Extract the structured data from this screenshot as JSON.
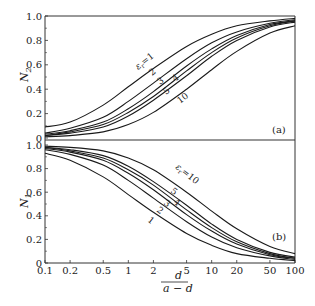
{
  "chart_data": [
    {
      "type": "line",
      "panel": "(a)",
      "title": "",
      "xlabel": "d / (a - d)",
      "ylabel": "N2",
      "xscale": "log",
      "xlim": [
        0.1,
        100
      ],
      "ylim": [
        0,
        1.0
      ],
      "grid": false,
      "x": [
        0.1,
        0.2,
        0.5,
        1,
        2,
        5,
        10,
        20,
        50,
        100
      ],
      "series": [
        {
          "name": "εr=1",
          "label": "εr=1",
          "values": [
            0.09,
            0.13,
            0.27,
            0.42,
            0.57,
            0.75,
            0.85,
            0.92,
            0.96,
            0.98
          ]
        },
        {
          "name": "εr=2",
          "label": "2",
          "values": [
            0.04,
            0.08,
            0.17,
            0.3,
            0.45,
            0.65,
            0.78,
            0.87,
            0.94,
            0.97
          ]
        },
        {
          "name": "εr=3",
          "label": "3",
          "values": [
            0.03,
            0.06,
            0.13,
            0.24,
            0.38,
            0.59,
            0.73,
            0.84,
            0.93,
            0.96
          ]
        },
        {
          "name": "εr=4",
          "label": "4",
          "values": [
            0.02,
            0.05,
            0.11,
            0.21,
            0.34,
            0.55,
            0.7,
            0.82,
            0.92,
            0.96
          ]
        },
        {
          "name": "εr=5",
          "label": "5",
          "values": [
            0.02,
            0.04,
            0.09,
            0.18,
            0.31,
            0.51,
            0.67,
            0.8,
            0.91,
            0.95
          ]
        },
        {
          "name": "εr=10",
          "label": "10",
          "values": [
            0.01,
            0.02,
            0.05,
            0.11,
            0.21,
            0.4,
            0.56,
            0.71,
            0.86,
            0.92
          ]
        }
      ],
      "yticks": [
        "0",
        "0.2",
        "0.4",
        "0.6",
        "0.8",
        "1.0"
      ]
    },
    {
      "type": "line",
      "panel": "(b)",
      "title": "",
      "xlabel": "d / (a - d)",
      "ylabel": "N1",
      "xscale": "log",
      "xlim": [
        0.1,
        100
      ],
      "ylim": [
        0,
        1.0
      ],
      "grid": false,
      "x": [
        0.1,
        0.2,
        0.5,
        1,
        2,
        5,
        10,
        20,
        50,
        100
      ],
      "series": [
        {
          "name": "εr=1",
          "label": "1",
          "values": [
            0.93,
            0.87,
            0.73,
            0.58,
            0.43,
            0.25,
            0.15,
            0.08,
            0.04,
            0.02
          ]
        },
        {
          "name": "εr=2",
          "label": "2",
          "values": [
            0.96,
            0.92,
            0.83,
            0.7,
            0.55,
            0.35,
            0.22,
            0.13,
            0.06,
            0.03
          ]
        },
        {
          "name": "εr=3",
          "label": "3",
          "values": [
            0.97,
            0.94,
            0.87,
            0.76,
            0.62,
            0.41,
            0.27,
            0.16,
            0.07,
            0.04
          ]
        },
        {
          "name": "εr=4",
          "label": "4",
          "values": [
            0.98,
            0.95,
            0.89,
            0.79,
            0.66,
            0.45,
            0.3,
            0.18,
            0.08,
            0.04
          ]
        },
        {
          "name": "εr=5",
          "label": "5",
          "values": [
            0.98,
            0.96,
            0.91,
            0.82,
            0.69,
            0.49,
            0.33,
            0.2,
            0.09,
            0.05
          ]
        },
        {
          "name": "εr=10",
          "label": "εr=10",
          "values": [
            0.99,
            0.98,
            0.95,
            0.89,
            0.79,
            0.6,
            0.44,
            0.29,
            0.14,
            0.08
          ]
        }
      ],
      "yticks": [
        "0",
        "0.2",
        "0.4",
        "0.6",
        "0.8",
        "1.0"
      ]
    }
  ],
  "axes": {
    "xticks": [
      "0.1",
      "0.2",
      "0.5",
      "1",
      "2",
      "5",
      "10",
      "20",
      "50",
      "100"
    ],
    "xlabel_num": "d",
    "xlabel_den": "a − d",
    "panel_a": {
      "ylabel_main": "N",
      "ylabel_sub": "2",
      "tag": "(a)",
      "eps_label_main": "ε",
      "eps_label_sub": "r",
      "eps_label_rest": "=1"
    },
    "panel_b": {
      "ylabel_main": "N",
      "ylabel_sub": "1",
      "tag": "(b)",
      "eps_label_main": "ε",
      "eps_label_sub": "r",
      "eps_label_rest": "=10"
    }
  },
  "style": {
    "line_color": "#1a1a1a",
    "axis_color": "#333333",
    "background": "#ffffff"
  }
}
